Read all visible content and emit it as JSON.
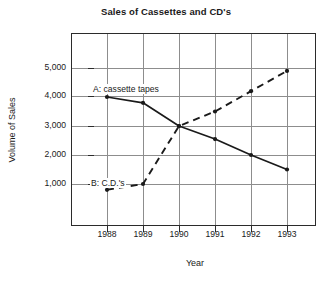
{
  "chart_data": {
    "type": "line",
    "title": "Sales of Cassettes and CD's",
    "xlabel": "Year",
    "ylabel": "Volume of Sales",
    "categories": [
      "1988",
      "1989",
      "1990",
      "1991",
      "1992",
      "1993"
    ],
    "x": [
      1988,
      1989,
      1990,
      1991,
      1992,
      1993
    ],
    "xlim": [
      1987.0,
      1993.8
    ],
    "ylim": [
      0,
      5700
    ],
    "ytick_labels": [
      "1,000",
      "2,000",
      "3,000",
      "4,000",
      "5,000"
    ],
    "yticks": [
      1000,
      2000,
      3000,
      4000,
      5000
    ],
    "grid": true,
    "legend": "inline-annotations",
    "series": [
      {
        "name": "A: cassette tapes",
        "key": "cassettes",
        "style": "solid",
        "marker": "filled-circle",
        "color": "#1a1a1a",
        "values": [
          4000,
          3800,
          3000,
          2550,
          2000,
          1500
        ]
      },
      {
        "name": "B: C.D.'s",
        "key": "cds",
        "style": "dashed",
        "marker": "filled-circle",
        "color": "#1a1a1a",
        "values": [
          800,
          1000,
          3000,
          3500,
          4200,
          4900
        ]
      }
    ],
    "annotations": [
      {
        "id": "a-label",
        "text": "A: cassette tapes",
        "near_series": "cassettes"
      },
      {
        "id": "b-label",
        "text": "B: C.D.'s",
        "near_series": "cds"
      }
    ]
  }
}
